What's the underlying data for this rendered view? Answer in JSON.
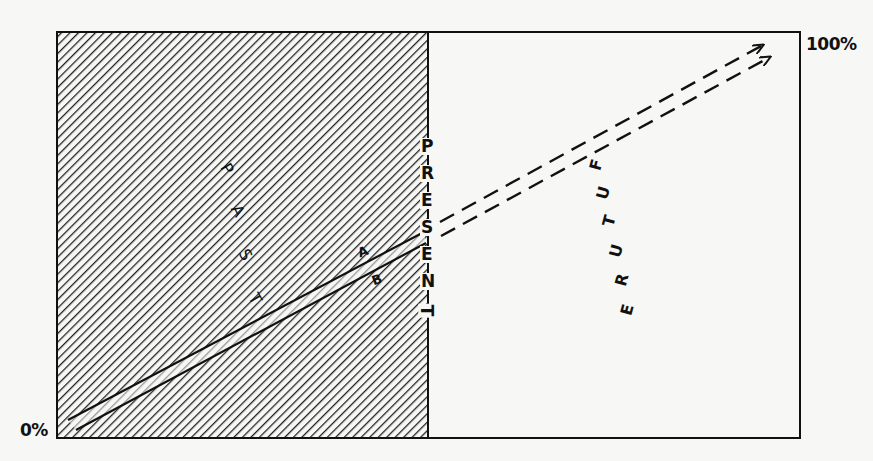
{
  "diagram": {
    "labels": {
      "top_percent": "100%",
      "bottom_percent": "0%",
      "past": [
        "P",
        "A",
        "S",
        "T"
      ],
      "present": [
        "P",
        "R",
        "E",
        "S",
        "E",
        "N",
        "T"
      ],
      "future": [
        "F",
        "U",
        "T",
        "U",
        "R",
        "E"
      ],
      "band_upper": "A",
      "band_lower": "B"
    },
    "regions": {
      "past": {
        "fill": "diagonal-hatch",
        "x_range": [
          57,
          428
        ]
      },
      "future": {
        "fill": "none",
        "x_range": [
          428,
          800
        ]
      }
    },
    "colors": {
      "ink": "#111111",
      "paper": "#f7f7f5"
    }
  }
}
